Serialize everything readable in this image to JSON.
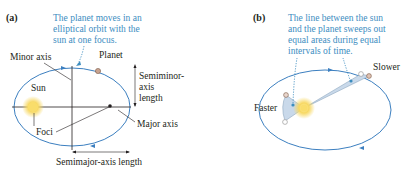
{
  "panel_a": {
    "label": "(a)",
    "caption_lines": [
      "The planet moves in an",
      "elliptical orbit with the",
      "sun at one focus."
    ],
    "labels": {
      "minor_axis": "Minor axis",
      "planet": "Planet",
      "sun": "Sun",
      "semiminor_1": "Semiminor-",
      "semiminor_2": "axis",
      "semiminor_3": "length",
      "foci": "Foci",
      "major_axis": "Major axis",
      "semimajor": "Semimajor-axis length"
    }
  },
  "panel_b": {
    "label": "(b)",
    "caption_lines": [
      "The line between the sun",
      "and the planet sweeps out",
      "equal areas during equal",
      "intervals of time."
    ],
    "labels": {
      "slower": "Slower",
      "faster": "Faster"
    }
  },
  "colors": {
    "orbit": "#3c7fc0",
    "caption": "#3c8dbf",
    "sun": "#f5d76e",
    "sweep_fill": "#c9d9ea",
    "planet": "#c9a38f"
  }
}
